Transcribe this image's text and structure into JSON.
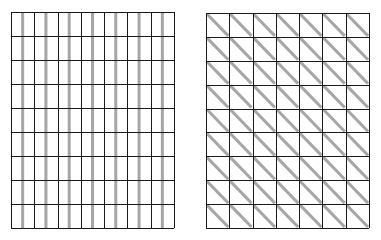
{
  "figure": {
    "background": "#ffffff",
    "line_color": "#1a1a1a",
    "shade_color": "#a6a6a6",
    "grids": [
      {
        "name": "vertical-stripe-grid",
        "pattern": "vertical-stripe",
        "rows": 9,
        "cols": 7,
        "x": 11,
        "y": 12,
        "width": 163,
        "height": 216
      },
      {
        "name": "diagonal-stripe-grid",
        "pattern": "diagonal-stripe",
        "rows": 9,
        "cols": 7,
        "x": 206,
        "y": 13,
        "width": 163,
        "height": 215
      }
    ]
  }
}
